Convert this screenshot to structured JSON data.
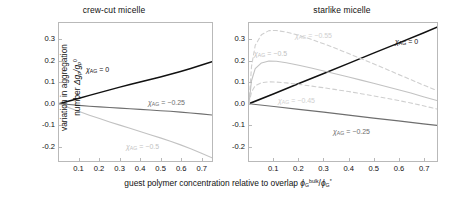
{
  "figure": {
    "xlabel_prefix": "guest polymer concentration relative to overlap ",
    "ylabel_line1": "variation in aggregation",
    "ylabel_line2": "number "
  },
  "axes": {
    "yticks": [
      "0.3",
      "0.2",
      "0.1",
      "0.0",
      "-0.1",
      "-0.2"
    ],
    "ytick_values": [
      0.3,
      0.2,
      0.1,
      0.0,
      -0.1,
      -0.2
    ],
    "xticks": [
      "0.1",
      "0.2",
      "0.3",
      "0.4",
      "0.5",
      "0.6",
      "0.7"
    ],
    "xtick_values": [
      0.1,
      0.2,
      0.3,
      0.4,
      0.5,
      0.6,
      0.7
    ],
    "xlim": [
      0.0,
      0.755
    ],
    "ylim": [
      -0.27,
      0.38
    ]
  },
  "colors": {
    "black": "#111111",
    "dark_gray": "#6e6e6e",
    "light_gray": "#c2c2c2",
    "lighter_gray": "#cfcfcf",
    "frame": "#b9b9b9"
  },
  "panels": [
    {
      "id": "left",
      "title": "crew-cut micelle"
    },
    {
      "id": "right",
      "title": "starlike micelle"
    }
  ],
  "labels": {
    "chi": "χ",
    "ag": "AG",
    "eq0": " = 0",
    "eq025": " = −0.25",
    "eq045": " = −0.45",
    "eq05": " = −0.5",
    "eq055": " = −0.55",
    "delta_g": "Δg",
    "p": "p",
    "slash": "/g",
    "zero": "0",
    "phi": "ϕ",
    "G": "G",
    "bulk": "bulk",
    "star": "*"
  },
  "chart_data": {
    "type": "line",
    "title": "",
    "xlabel": "guest polymer concentration relative to overlap ϕ_G^bulk/ϕ_G*",
    "ylabel": "variation in aggregation number Δg_p/g_p^0",
    "xlim": [
      0.0,
      0.755
    ],
    "ylim": [
      -0.27,
      0.38
    ],
    "grid": false,
    "legend": "inline-annotations",
    "panels": [
      {
        "name": "crew-cut micelle",
        "series": [
          {
            "name": "χAG = 0",
            "color": "#111111",
            "style": "solid",
            "label": "χAG = 0",
            "x": [
              0.0,
              0.05,
              0.1,
              0.15,
              0.2,
              0.25,
              0.3,
              0.35,
              0.4,
              0.45,
              0.5,
              0.55,
              0.6,
              0.65,
              0.7,
              0.755
            ],
            "y": [
              0.0,
              0.013,
              0.026,
              0.039,
              0.052,
              0.065,
              0.078,
              0.09,
              0.102,
              0.114,
              0.126,
              0.139,
              0.152,
              0.166,
              0.181,
              0.198
            ]
          },
          {
            "name": "χAG = −0.25",
            "color": "#6e6e6e",
            "style": "solid",
            "label": "χAG = −0.25",
            "x": [
              0.0,
              0.05,
              0.1,
              0.15,
              0.2,
              0.25,
              0.3,
              0.35,
              0.4,
              0.45,
              0.5,
              0.55,
              0.6,
              0.65,
              0.7,
              0.755
            ],
            "y": [
              0.0,
              -0.004,
              -0.008,
              -0.012,
              -0.015,
              -0.018,
              -0.021,
              -0.024,
              -0.027,
              -0.03,
              -0.033,
              -0.036,
              -0.04,
              -0.044,
              -0.048,
              -0.053
            ]
          },
          {
            "name": "χAG = −0.5",
            "color": "#c2c2c2",
            "style": "solid",
            "label": "χAG = −0.5",
            "x": [
              0.0,
              0.05,
              0.1,
              0.15,
              0.2,
              0.25,
              0.3,
              0.35,
              0.4,
              0.45,
              0.5,
              0.55,
              0.6,
              0.65,
              0.7,
              0.755
            ],
            "y": [
              0.0,
              -0.019,
              -0.037,
              -0.054,
              -0.07,
              -0.086,
              -0.101,
              -0.116,
              -0.131,
              -0.146,
              -0.161,
              -0.177,
              -0.194,
              -0.212,
              -0.232,
              -0.255
            ]
          }
        ]
      },
      {
        "name": "starlike micelle",
        "series": [
          {
            "name": "χAG = 0",
            "color": "#111111",
            "style": "solid",
            "label": "χAG = 0",
            "x": [
              0.0,
              0.1,
              0.2,
              0.3,
              0.4,
              0.5,
              0.6,
              0.7,
              0.755
            ],
            "y": [
              0.0,
              0.047,
              0.095,
              0.142,
              0.19,
              0.238,
              0.285,
              0.333,
              0.36
            ]
          },
          {
            "name": "χAG = −0.25",
            "color": "#6e6e6e",
            "style": "solid",
            "label": "χAG = −0.25",
            "x": [
              0.0,
              0.1,
              0.2,
              0.3,
              0.4,
              0.5,
              0.6,
              0.7,
              0.755
            ],
            "y": [
              0.0,
              -0.013,
              -0.027,
              -0.04,
              -0.054,
              -0.068,
              -0.081,
              -0.095,
              -0.102
            ]
          },
          {
            "name": "χAG = −0.55",
            "color": "#cfcfcf",
            "style": "dashed",
            "label": "χAG = −0.55",
            "x": [
              0.0,
              0.01,
              0.025,
              0.05,
              0.08,
              0.11,
              0.15,
              0.2,
              0.25,
              0.3,
              0.35,
              0.4,
              0.45,
              0.5,
              0.55,
              0.6,
              0.65,
              0.7,
              0.755
            ],
            "y": [
              0.0,
              0.175,
              0.275,
              0.325,
              0.344,
              0.345,
              0.337,
              0.322,
              0.303,
              0.282,
              0.26,
              0.236,
              0.212,
              0.188,
              0.163,
              0.138,
              0.113,
              0.088,
              0.062
            ]
          },
          {
            "name": "χAG = −0.5",
            "color": "#c2c2c2",
            "style": "solid",
            "label": "χAG = −0.5",
            "x": [
              0.0,
              0.01,
              0.025,
              0.05,
              0.08,
              0.11,
              0.15,
              0.2,
              0.25,
              0.3,
              0.35,
              0.4,
              0.45,
              0.5,
              0.55,
              0.6,
              0.65,
              0.7,
              0.755
            ],
            "y": [
              0.0,
              0.108,
              0.165,
              0.192,
              0.201,
              0.2,
              0.193,
              0.181,
              0.168,
              0.154,
              0.14,
              0.126,
              0.111,
              0.096,
              0.081,
              0.066,
              0.05,
              0.033,
              0.015
            ]
          },
          {
            "name": "χAG = −0.45",
            "color": "#cfcfcf",
            "style": "dashed",
            "label": "χAG = −0.45",
            "x": [
              0.0,
              0.01,
              0.025,
              0.05,
              0.08,
              0.11,
              0.15,
              0.2,
              0.25,
              0.3,
              0.35,
              0.4,
              0.45,
              0.5,
              0.55,
              0.6,
              0.65,
              0.7,
              0.755
            ],
            "y": [
              0.0,
              0.055,
              0.085,
              0.099,
              0.103,
              0.102,
              0.098,
              0.091,
              0.083,
              0.075,
              0.066,
              0.057,
              0.047,
              0.037,
              0.026,
              0.015,
              0.003,
              -0.01,
              -0.025
            ]
          }
        ]
      }
    ]
  }
}
